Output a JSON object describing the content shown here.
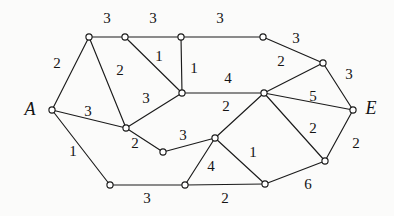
{
  "figure": {
    "name": "weighted-graph-diagram",
    "background_color": "#fbfbfa",
    "ink_color": "#1b1b1b",
    "width": 394,
    "height": 216
  },
  "terminals": [
    {
      "id": "A",
      "label": "A",
      "label_x": 30,
      "label_y": 111
    },
    {
      "id": "E",
      "label": "E",
      "label_x": 371,
      "label_y": 110
    }
  ],
  "nodes": [
    {
      "id": "A",
      "x": 52,
      "y": 110
    },
    {
      "id": "n1",
      "x": 89,
      "y": 37
    },
    {
      "id": "n2",
      "x": 125,
      "y": 37
    },
    {
      "id": "n3",
      "x": 181,
      "y": 37
    },
    {
      "id": "n4",
      "x": 263,
      "y": 37
    },
    {
      "id": "n5",
      "x": 323,
      "y": 63
    },
    {
      "id": "E",
      "x": 353,
      "y": 110
    },
    {
      "id": "c1",
      "x": 182,
      "y": 93
    },
    {
      "id": "c2",
      "x": 264,
      "y": 93
    },
    {
      "id": "m1",
      "x": 126,
      "y": 128
    },
    {
      "id": "m2",
      "x": 163,
      "y": 152
    },
    {
      "id": "m3",
      "x": 215,
      "y": 138
    },
    {
      "id": "b1",
      "x": 110,
      "y": 185
    },
    {
      "id": "b2",
      "x": 185,
      "y": 185
    },
    {
      "id": "b3",
      "x": 265,
      "y": 184
    },
    {
      "id": "r1",
      "x": 325,
      "y": 161
    }
  ],
  "edges": [
    {
      "from": "n1",
      "to": "n2",
      "weight": "3",
      "lx": 107,
      "ly": 20
    },
    {
      "from": "n2",
      "to": "n3",
      "weight": "3",
      "lx": 153,
      "ly": 20
    },
    {
      "from": "n3",
      "to": "n4",
      "weight": "3",
      "lx": 220,
      "ly": 20
    },
    {
      "from": "n4",
      "to": "n5",
      "weight": "3",
      "lx": 296,
      "ly": 40
    },
    {
      "from": "n5",
      "to": "E",
      "weight": "3",
      "lx": 349,
      "ly": 76
    },
    {
      "from": "A",
      "to": "n1",
      "weight": "2",
      "lx": 57,
      "ly": 65
    },
    {
      "from": "n1",
      "to": "m1",
      "weight": "2",
      "lx": 120,
      "ly": 72
    },
    {
      "from": "n2",
      "to": "c1",
      "weight": "1",
      "lx": 159,
      "ly": 58
    },
    {
      "from": "n3",
      "to": "c1",
      "weight": "1",
      "lx": 194,
      "ly": 70
    },
    {
      "from": "A",
      "to": "m1",
      "weight": "3",
      "lx": 88,
      "ly": 113
    },
    {
      "from": "m1",
      "to": "c1",
      "weight": "3",
      "lx": 146,
      "ly": 100
    },
    {
      "from": "c1",
      "to": "c2",
      "weight": "4",
      "lx": 228,
      "ly": 80
    },
    {
      "from": "c2",
      "to": "n5",
      "weight": "2",
      "lx": 281,
      "ly": 63
    },
    {
      "from": "c2",
      "to": "E",
      "weight": "5",
      "lx": 313,
      "ly": 98
    },
    {
      "from": "A",
      "to": "b1",
      "weight": "1",
      "lx": 73,
      "ly": 153
    },
    {
      "from": "m1",
      "to": "m2",
      "weight": "2",
      "lx": 135,
      "ly": 145
    },
    {
      "from": "m2",
      "to": "m3",
      "weight": "3",
      "lx": 183,
      "ly": 137
    },
    {
      "from": "c2",
      "to": "m3",
      "weight": "2",
      "lx": 226,
      "ly": 108
    },
    {
      "from": "m3",
      "to": "b2",
      "weight": "4",
      "lx": 211,
      "ly": 168
    },
    {
      "from": "m3",
      "to": "b3",
      "weight": "1",
      "lx": 253,
      "ly": 154
    },
    {
      "from": "b1",
      "to": "b2",
      "weight": "3",
      "lx": 147,
      "ly": 200
    },
    {
      "from": "b2",
      "to": "b3",
      "weight": "2",
      "lx": 225,
      "ly": 200
    },
    {
      "from": "b3",
      "to": "r1",
      "weight": "6",
      "lx": 308,
      "ly": 186
    },
    {
      "from": "c2",
      "to": "r1",
      "weight": "2",
      "lx": 313,
      "ly": 130
    },
    {
      "from": "r1",
      "to": "E",
      "weight": "2",
      "lx": 356,
      "ly": 145
    }
  ],
  "chart_data": {
    "type": "diagram",
    "title": "",
    "node_count": 16,
    "edge_count": 25,
    "weights": [
      "3",
      "3",
      "3",
      "3",
      "3",
      "2",
      "2",
      "1",
      "1",
      "3",
      "3",
      "4",
      "2",
      "5",
      "1",
      "2",
      "3",
      "2",
      "4",
      "1",
      "3",
      "2",
      "6",
      "2",
      "2"
    ]
  }
}
